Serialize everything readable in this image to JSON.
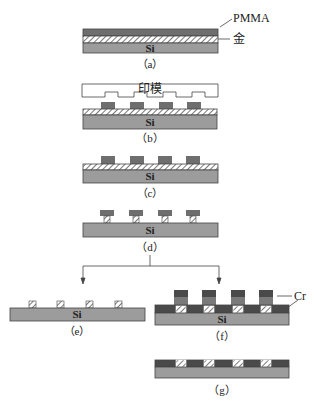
{
  "colors": {
    "pmma": "#6e6e6e",
    "gold_bg": "#ffffff",
    "gold_hatch": "#555555",
    "si": "#9c9c9c",
    "cr": "#4a4a4a",
    "outline": "#444444",
    "stamp_fill": "#ffffff"
  },
  "labels": {
    "pmma": "PMMA",
    "gold": "金",
    "stamp": "印模",
    "si": "Si",
    "cr": "Cr"
  },
  "captions": {
    "a": "（a）",
    "b": "（b）",
    "c": "（c）",
    "d": "（d）",
    "e": "（e）",
    "f": "（f）",
    "g": "（g）"
  },
  "steps": [
    {
      "id": "a",
      "description": "Si substrate coated with gold layer and PMMA"
    },
    {
      "id": "b",
      "description": "Stamp pressed into PMMA"
    },
    {
      "id": "c",
      "description": "Patterned PMMA on gold"
    },
    {
      "id": "d",
      "description": "Gold etched under PMMA blocks"
    },
    {
      "id": "e",
      "description": "PMMA removed leaving gold features"
    },
    {
      "id": "f",
      "description": "Cr deposited"
    },
    {
      "id": "g",
      "description": "Lift-off leaving Cr between gold features"
    }
  ]
}
